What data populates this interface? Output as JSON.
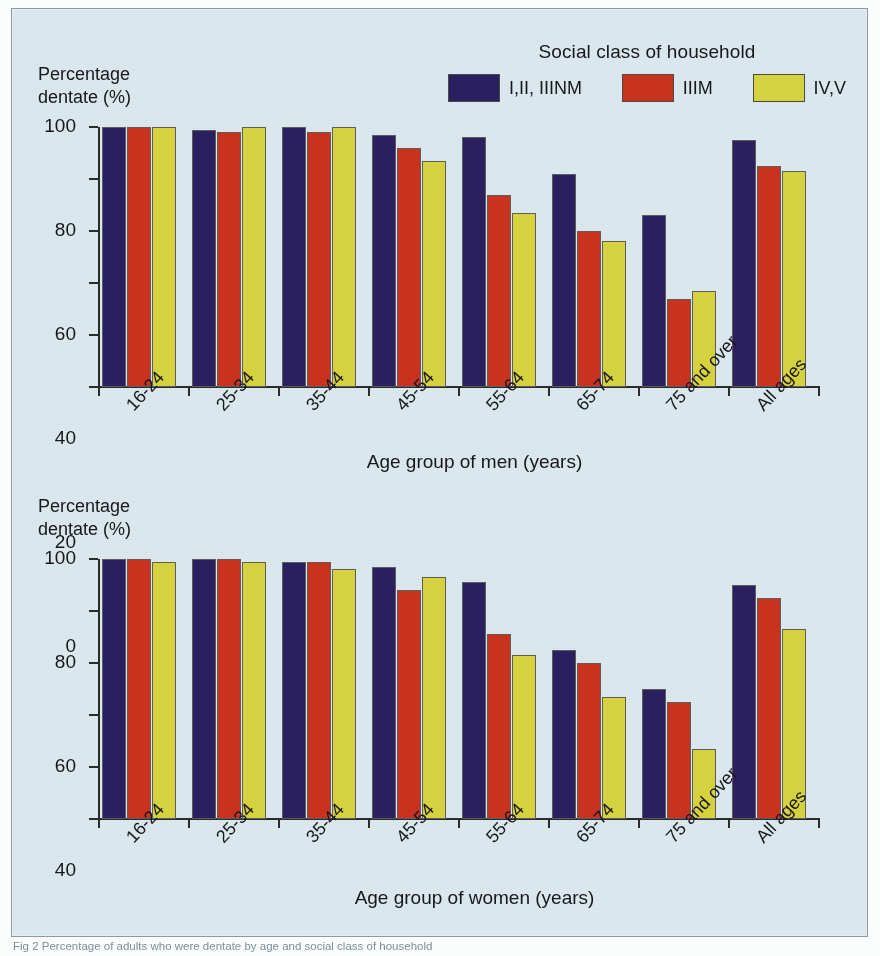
{
  "figure": {
    "background_color": "#dbe8ee",
    "caption": "Fig 2 Percentage of adults who were dentate by age and social class of household"
  },
  "legend": {
    "title": "Social class of household",
    "items": [
      {
        "label": "I,II, IIINM",
        "color": "#2a2060",
        "icon": "legend-swatch"
      },
      {
        "label": "IIIM",
        "color": "#c8321e",
        "icon": "legend-swatch"
      },
      {
        "label": "IV,V",
        "color": "#d6d23f",
        "icon": "legend-swatch"
      }
    ]
  },
  "axes": {
    "y_label": "Percentage\ndentate (%)",
    "y_ticks": [
      "0",
      "20",
      "40",
      "60",
      "80",
      "100"
    ],
    "y_min": 0,
    "y_max": 100,
    "x_categories": [
      "16-24",
      "25-34",
      "35-44",
      "45-54",
      "55-64",
      "65-74",
      "75 and over",
      "All ages"
    ],
    "x_title_men": "Age group of men (years)",
    "x_title_women": "Age group of women (years)"
  },
  "chart_data": [
    {
      "type": "bar",
      "title": "Percentage dentate by age and social class — men",
      "xlabel": "Age group of men (years)",
      "ylabel": "Percentage dentate (%)",
      "ylim": [
        0,
        100
      ],
      "yticks": [
        0,
        20,
        40,
        60,
        80,
        100
      ],
      "grid": false,
      "legend_position": "top-right",
      "categories": [
        "16-24",
        "25-34",
        "35-44",
        "45-54",
        "55-64",
        "65-74",
        "75 and over",
        "All ages"
      ],
      "series": [
        {
          "name": "I,II, IIINM",
          "color": "#2a2060",
          "values": [
            100,
            99,
            100,
            97,
            96,
            82,
            66,
            95
          ]
        },
        {
          "name": "IIIM",
          "color": "#c8321e",
          "values": [
            100,
            98,
            98,
            92,
            74,
            60,
            34,
            85
          ]
        },
        {
          "name": "IV,V",
          "color": "#d6d23f",
          "values": [
            100,
            100,
            100,
            87,
            67,
            56,
            37,
            83
          ]
        }
      ]
    },
    {
      "type": "bar",
      "title": "Percentage dentate by age and social class — women",
      "xlabel": "Age group of women (years)",
      "ylabel": "Percentage dentate (%)",
      "ylim": [
        0,
        100
      ],
      "yticks": [
        0,
        20,
        40,
        60,
        80,
        100
      ],
      "grid": false,
      "legend_position": "top-right",
      "categories": [
        "16-24",
        "25-34",
        "35-44",
        "45-54",
        "55-64",
        "65-74",
        "75 and over",
        "All ages"
      ],
      "series": [
        {
          "name": "I,II, IIINM",
          "color": "#2a2060",
          "values": [
            100,
            100,
            99,
            97,
            91,
            65,
            50,
            90
          ]
        },
        {
          "name": "IIIM",
          "color": "#c8321e",
          "values": [
            100,
            100,
            99,
            88,
            71,
            60,
            45,
            85
          ]
        },
        {
          "name": "IV,V",
          "color": "#d6d23f",
          "values": [
            99,
            99,
            96,
            93,
            63,
            47,
            27,
            73
          ]
        }
      ]
    }
  ]
}
